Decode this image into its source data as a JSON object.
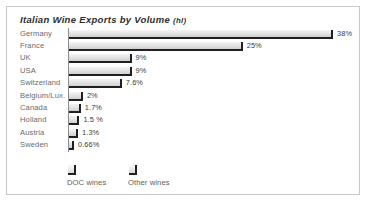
{
  "chart": {
    "title_main": "Italian Wine Exports by Volume",
    "title_unit": "(hl)"
  },
  "legend": {
    "items": [
      {
        "label": "DOC wines",
        "swatch": "bar-swatch-doc",
        "x": 0
      },
      {
        "label": "Other wines",
        "swatch": "bar-swatch-other",
        "x": 61
      }
    ]
  },
  "chart_data": {
    "type": "bar",
    "orientation": "horizontal",
    "title": "Italian Wine Exports by Volume (hl)",
    "xlabel": "",
    "ylabel": "",
    "unit": "hl",
    "grid": false,
    "legend_position": "bottom-left",
    "legend_entries": [
      "DOC wines",
      "Other wines"
    ],
    "xlim": [
      0,
      38
    ],
    "categories": [
      "Germany",
      "France",
      "UK",
      "USA",
      "Switzerland",
      "Belgium/Lux.",
      "Canada",
      "Holland",
      "Austria",
      "Sweden"
    ],
    "values": [
      38,
      25,
      9,
      9,
      7.6,
      2,
      1.7,
      1.5,
      1.3,
      0.66
    ],
    "value_labels": [
      "38%",
      "25%",
      "9%",
      "9%",
      "7.6%",
      "2%",
      "1.7%",
      "1.5 %",
      "1.3%",
      "0.66%"
    ]
  }
}
